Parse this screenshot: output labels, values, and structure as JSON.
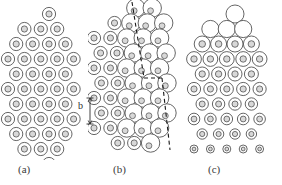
{
  "figure": {
    "type": "crystal-lattice-diagram",
    "width": 282,
    "height": 185,
    "background": "#ffffff",
    "stroke_color": "#4a4a4a",
    "inner_fill": "#d8d8d8",
    "dash_color": "#1a1a1a"
  },
  "panels": [
    {
      "id": "a",
      "label": "(a)",
      "description": "perfect hexagonal lattice of concentric atoms",
      "origin_x": 8,
      "origin_y": 14,
      "dx": 16.4,
      "dy": 15.0,
      "outer_r": 6.6,
      "inner_r": 3.1,
      "rows": [
        {
          "y_index": 0,
          "offset": 0.5,
          "count": 1,
          "start": 2,
          "kind": "normal"
        },
        {
          "y_index": 1,
          "offset": 0.0,
          "count": 3,
          "start": 1,
          "kind": "normal"
        },
        {
          "y_index": 2,
          "offset": 0.5,
          "count": 4,
          "start": 0,
          "kind": "normal"
        },
        {
          "y_index": 3,
          "offset": 0.0,
          "count": 5,
          "start": 0,
          "kind": "normal"
        },
        {
          "y_index": 4,
          "offset": 0.5,
          "count": 4,
          "start": 0,
          "kind": "normal"
        },
        {
          "y_index": 5,
          "offset": 0.0,
          "count": 5,
          "start": 0,
          "kind": "normal"
        },
        {
          "y_index": 6,
          "offset": 0.5,
          "count": 4,
          "start": 0,
          "kind": "normal"
        },
        {
          "y_index": 7,
          "offset": 0.0,
          "count": 5,
          "start": 0,
          "kind": "normal"
        },
        {
          "y_index": 8,
          "offset": 0.5,
          "count": 4,
          "start": 0,
          "kind": "normal"
        },
        {
          "y_index": 9,
          "offset": 0.0,
          "count": 3,
          "start": 1,
          "kind": "normal"
        },
        {
          "y_index": 10,
          "offset": 0.5,
          "count": 1,
          "start": 2,
          "kind": "normal"
        }
      ]
    },
    {
      "id": "b",
      "label": "(b)",
      "description": "lattice containing an edge dislocation with Burgers circuit",
      "origin_x": 6,
      "origin_y": 8,
      "dx": 16.4,
      "dy": 15.0,
      "outer_r": 6.6,
      "inner_r": 3.1,
      "large_r": 9.2,
      "rows": [
        {
          "y_index": 0,
          "offset": 0.55,
          "count": 2,
          "start": 2,
          "kind": "large"
        },
        {
          "y_index": 1,
          "offset": 0.25,
          "count": 1,
          "start": 1,
          "kind": "normal"
        },
        {
          "y_index": 1,
          "offset": 0.25,
          "count": 3,
          "start": 2,
          "kind": "large"
        },
        {
          "y_index": 2,
          "offset": 0.0,
          "count": 2,
          "start": 0,
          "kind": "normal"
        },
        {
          "y_index": 2,
          "offset": 0.0,
          "count": 3,
          "start": 2,
          "kind": "large"
        },
        {
          "y_index": 3,
          "offset": 0.4,
          "count": 2,
          "start": 0,
          "kind": "normal"
        },
        {
          "y_index": 3,
          "offset": 0.4,
          "count": 3,
          "start": 2,
          "kind": "large"
        },
        {
          "y_index": 4,
          "offset": 0.0,
          "count": 2,
          "start": 0,
          "kind": "normal"
        },
        {
          "y_index": 4,
          "offset": 0.0,
          "count": 3,
          "start": 2,
          "kind": "large"
        },
        {
          "y_index": 5,
          "offset": 0.45,
          "count": 2,
          "start": 0,
          "kind": "normal"
        },
        {
          "y_index": 5,
          "offset": 0.45,
          "count": 3,
          "start": 2,
          "kind": "large"
        },
        {
          "y_index": 6,
          "offset": 0.0,
          "count": 2,
          "start": 0,
          "kind": "normal"
        },
        {
          "y_index": 6,
          "offset": 0.0,
          "count": 3,
          "start": 2,
          "kind": "large"
        },
        {
          "y_index": 7,
          "offset": 0.45,
          "count": 2,
          "start": 0,
          "kind": "normal"
        },
        {
          "y_index": 7,
          "offset": 0.45,
          "count": 3,
          "start": 2,
          "kind": "large"
        },
        {
          "y_index": 8,
          "offset": 0.0,
          "count": 2,
          "start": 0,
          "kind": "normal"
        },
        {
          "y_index": 8,
          "offset": 0.0,
          "count": 3,
          "start": 2,
          "kind": "large"
        },
        {
          "y_index": 9,
          "offset": 0.45,
          "count": 2,
          "start": 1,
          "kind": "normal"
        },
        {
          "y_index": 9,
          "offset": 0.45,
          "count": 1,
          "start": 3,
          "kind": "large"
        }
      ],
      "burgers_circuit": {
        "style": "dashed",
        "segments": [
          {
            "x1": 44,
            "y1": 2,
            "x2": 56,
            "y2": 78
          },
          {
            "x1": 56,
            "y1": 78,
            "x2": 74,
            "y2": 78
          },
          {
            "x1": 74,
            "y1": 78,
            "x2": 82,
            "y2": 150
          }
        ]
      }
    },
    {
      "id": "c",
      "label": "(c)",
      "description": "lattice with vertical strain gradient: large atoms at top, small atoms at bottom",
      "origin_x": 8,
      "origin_y": 14,
      "dx": 16.4,
      "dy": 15.0,
      "rows": [
        {
          "y_index": 0,
          "offset": 0.5,
          "count": 1,
          "start": 2,
          "outer_r": 9.0,
          "inner_r": 0
        },
        {
          "y_index": 1,
          "offset": 0.0,
          "count": 3,
          "start": 1,
          "outer_r": 8.6,
          "inner_r": 0
        },
        {
          "y_index": 2,
          "offset": 0.5,
          "count": 4,
          "start": 0,
          "outer_r": 8.0,
          "inner_r": 3.3
        },
        {
          "y_index": 3,
          "offset": 0.0,
          "count": 5,
          "start": 0,
          "outer_r": 7.4,
          "inner_r": 3.2
        },
        {
          "y_index": 4,
          "offset": 0.5,
          "count": 4,
          "start": 0,
          "outer_r": 7.0,
          "inner_r": 3.2
        },
        {
          "y_index": 5,
          "offset": 0.0,
          "count": 5,
          "start": 0,
          "outer_r": 6.6,
          "inner_r": 3.1
        },
        {
          "y_index": 6,
          "offset": 0.5,
          "count": 4,
          "start": 0,
          "outer_r": 6.2,
          "inner_r": 3.0
        },
        {
          "y_index": 7,
          "offset": 0.0,
          "count": 5,
          "start": 0,
          "outer_r": 5.8,
          "inner_r": 2.9
        },
        {
          "y_index": 8,
          "offset": 0.5,
          "count": 4,
          "start": 0,
          "outer_r": 5.2,
          "inner_r": 2.6
        },
        {
          "y_index": 9,
          "offset": 0.0,
          "count": 5,
          "start": 0,
          "outer_r": 4.0,
          "inner_r": 1.9
        },
        {
          "y_index": 10,
          "offset": 0.5,
          "count": 4,
          "start": 0,
          "outer_r": 3.0,
          "inner_r": 1.3
        },
        {
          "y_index": 11,
          "offset": 0.0,
          "count": 1,
          "start": 2,
          "outer_r": 2.6,
          "inner_r": 1.1
        }
      ]
    }
  ],
  "annotations": {
    "burgers_vector": {
      "letter": "b",
      "letter_x": 78,
      "letter_y": 106,
      "arrow_x": 90,
      "arrow_top": 98,
      "arrow_bottom": 124
    }
  }
}
